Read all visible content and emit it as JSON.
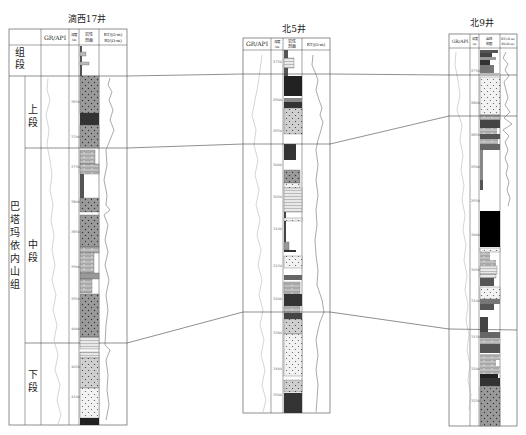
{
  "wells": [
    {
      "name": "滴西17井",
      "headers": {
        "gr": "GR/API",
        "depth": "深度/m",
        "lith": "岩性剖面",
        "rt": "RT/(Ω·m)",
        "ri": "RI/(Ω·m)"
      },
      "depth_ticks": [
        "3650",
        "3700",
        "3750",
        "3800",
        "3850",
        "3900",
        "3950",
        "4000",
        "4050",
        "4100"
      ]
    },
    {
      "name": "北5井",
      "headers": {
        "gr": "GR/API",
        "depth": "深度/m",
        "lith": "岩性剖面",
        "rt": "RT/(Ω·m)"
      },
      "depth_ticks": [
        "2750",
        "2900",
        "2950",
        "3000",
        "3050",
        "3100",
        "3150",
        "3200",
        "3300",
        "3400",
        "3500"
      ]
    },
    {
      "name": "北9井",
      "headers": {
        "gr": "GR/API",
        "depth": "深度/m",
        "lith": "岩性剖面",
        "rt": "RT/(Ω·m)",
        "ri": "RI/(Ω·m)"
      },
      "depth_ticks": [
        "2750",
        "2800",
        "2850",
        "2900",
        "2950",
        "3000",
        "3050",
        "3100",
        "3150",
        "3200",
        "3250",
        "3300"
      ]
    }
  ],
  "strat_column": {
    "header": "组段",
    "formation": "巴塔玛依内山组",
    "members": [
      "上段",
      "中段",
      "下段"
    ]
  }
}
